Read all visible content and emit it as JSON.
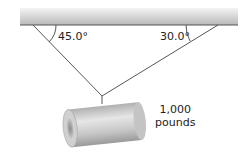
{
  "diagram": {
    "title": "",
    "ceiling": {
      "color_top": "#bdbdbd",
      "color_bottom": "#f2f2f2",
      "edge_color": "#555555"
    },
    "angles": [
      {
        "id": "left",
        "label": "45.0°"
      },
      {
        "id": "right",
        "label": "30.0°"
      }
    ],
    "load": {
      "weight_value": "1,000",
      "weight_unit": "pounds"
    }
  }
}
